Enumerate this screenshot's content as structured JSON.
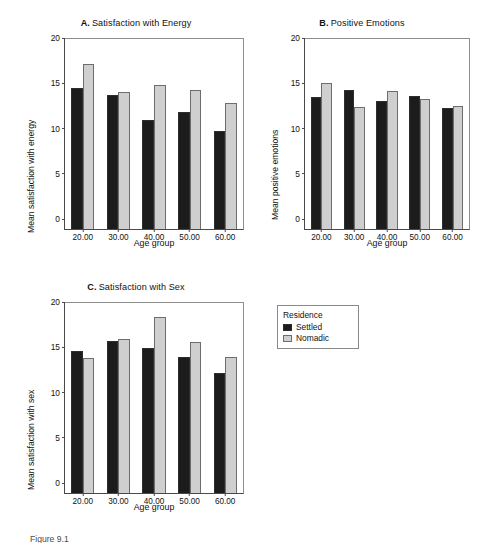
{
  "figure": {
    "caption": "Figure 9.1",
    "background_color": "#ffffff"
  },
  "legend": {
    "title": "Residence",
    "position": "right-of-panel-c",
    "entries": [
      {
        "label": "Settled",
        "color": "#1c1c1c"
      },
      {
        "label": "Nomadic",
        "color": "#cfcfcf"
      }
    ]
  },
  "panels": [
    {
      "id": "panel-a",
      "letter": "A.",
      "title": "Satisfaction with Energy"
    },
    {
      "id": "panel-b",
      "letter": "B.",
      "title": "Positive Emotions"
    },
    {
      "id": "panel-c",
      "letter": "C.",
      "title": "Satisfaction with Sex"
    }
  ],
  "chart_data": [
    {
      "type": "bar",
      "panel": "A",
      "title": "A.  Satisfaction with Energy",
      "xlabel": "Age group",
      "ylabel": "Mean satisfaction with energy",
      "categories": [
        "20.00",
        "30.00",
        "40.00",
        "50.00",
        "60.00"
      ],
      "ylim": [
        0,
        21
      ],
      "yticks": [
        0,
        5,
        10,
        15,
        20
      ],
      "grid": false,
      "legend_position": "external-right",
      "series": [
        {
          "name": "Settled",
          "color": "#1c1c1c",
          "values": [
            15.6,
            14.8,
            12.0,
            12.9,
            10.8
          ]
        },
        {
          "name": "Nomadic",
          "color": "#cfcfcf",
          "values": [
            18.2,
            15.1,
            15.9,
            15.4,
            13.9
          ]
        }
      ]
    },
    {
      "type": "bar",
      "panel": "B",
      "title": "B.  Positive Emotions",
      "xlabel": "Age group",
      "ylabel": "Mean positive emotions",
      "categories": [
        "20.00",
        "30.00",
        "40.00",
        "50.00",
        "60.00"
      ],
      "ylim": [
        0,
        21
      ],
      "yticks": [
        0,
        5,
        10,
        15,
        20
      ],
      "grid": false,
      "legend_position": "external-right",
      "series": [
        {
          "name": "Settled",
          "color": "#1c1c1c",
          "values": [
            14.6,
            15.4,
            14.2,
            14.7,
            13.4
          ]
        },
        {
          "name": "Nomadic",
          "color": "#cfcfcf",
          "values": [
            16.1,
            13.5,
            15.2,
            14.4,
            13.6
          ]
        }
      ]
    },
    {
      "type": "bar",
      "panel": "C",
      "title": "C.  Satisfaction with Sex",
      "xlabel": "Age group",
      "ylabel": "Mean satisfaction with sex",
      "categories": [
        "20.00",
        "30.00",
        "40.00",
        "50.00",
        "60.00"
      ],
      "ylim": [
        0,
        21
      ],
      "yticks": [
        0,
        5,
        10,
        15,
        20
      ],
      "grid": false,
      "legend_position": "external-right",
      "series": [
        {
          "name": "Settled",
          "color": "#1c1c1c",
          "values": [
            15.7,
            16.8,
            16.0,
            15.0,
            13.3
          ]
        },
        {
          "name": "Nomadic",
          "color": "#cfcfcf",
          "values": [
            14.9,
            17.0,
            19.5,
            16.7,
            15.0
          ]
        }
      ]
    }
  ]
}
